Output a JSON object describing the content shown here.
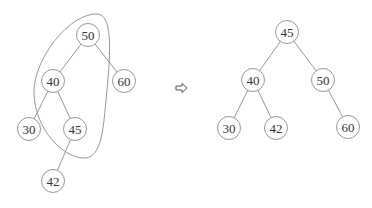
{
  "diagram": {
    "type": "binary-search-tree-rotation",
    "before": {
      "nodes": [
        {
          "id": "b50",
          "label": "50",
          "x": 88,
          "y": 35
        },
        {
          "id": "b40",
          "label": "40",
          "x": 53,
          "y": 81
        },
        {
          "id": "b60",
          "label": "60",
          "x": 124,
          "y": 81
        },
        {
          "id": "b30",
          "label": "30",
          "x": 29,
          "y": 129
        },
        {
          "id": "b45",
          "label": "45",
          "x": 75,
          "y": 129
        },
        {
          "id": "b42",
          "label": "42",
          "x": 53,
          "y": 181
        }
      ],
      "edges": [
        [
          "50",
          "40"
        ],
        [
          "50",
          "60"
        ],
        [
          "40",
          "30"
        ],
        [
          "40",
          "45"
        ],
        [
          "45",
          "42"
        ]
      ],
      "highlighted_group": [
        "50",
        "40",
        "45"
      ]
    },
    "arrow": {
      "symbol": "⇨",
      "x": 181,
      "y": 88
    },
    "after": {
      "nodes": [
        {
          "id": "a45",
          "label": "45",
          "x": 287,
          "y": 32
        },
        {
          "id": "a40",
          "label": "40",
          "x": 253,
          "y": 80
        },
        {
          "id": "a50",
          "label": "50",
          "x": 323,
          "y": 80
        },
        {
          "id": "a30",
          "label": "30",
          "x": 229,
          "y": 128
        },
        {
          "id": "a42",
          "label": "42",
          "x": 276,
          "y": 128
        },
        {
          "id": "a60",
          "label": "60",
          "x": 348,
          "y": 127
        }
      ],
      "edges": [
        [
          "45",
          "40"
        ],
        [
          "45",
          "50"
        ],
        [
          "40",
          "30"
        ],
        [
          "40",
          "42"
        ],
        [
          "50",
          "60"
        ]
      ]
    },
    "colors": {
      "stroke": "#8a8a8a",
      "text": "#333333",
      "background": "#ffffff"
    }
  }
}
